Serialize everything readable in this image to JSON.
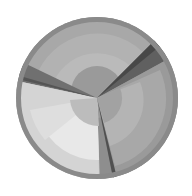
{
  "image": {
    "description": "Grayscale rendered disc with concentric shaded rings divided into three wedge sectors",
    "background": "#ffffff",
    "center": [
      97,
      98
    ],
    "radius": 81,
    "rings": 6,
    "sectors": [
      {
        "name": "upper",
        "tone": "#a6a6a6"
      },
      {
        "name": "left-lower",
        "tone": "#d0d0d0"
      },
      {
        "name": "right",
        "tone": "#a0a0a0"
      }
    ]
  }
}
